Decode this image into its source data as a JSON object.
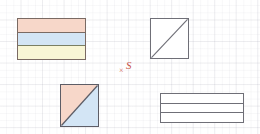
{
  "canvas": {
    "width": 260,
    "height": 134,
    "background_color": "#ffffff",
    "description": "Graph-paper worksheet with four geometric figures and a centre annotation"
  },
  "grid": {
    "name": "graph-paper-grid",
    "major_spacing_px": 21.5,
    "minor_spacing_px": 7.2,
    "major_color": "#b4b4be",
    "minor_color": "#aaaab9",
    "visible": true
  },
  "palette": {
    "pink": "#f7d7c9",
    "blue": "#d3e5f5",
    "yellow": "#f8f6d6",
    "outline_warm": "#7a6a63",
    "outline_olive": "#7a7f63",
    "outline_gray": "#6f6f77",
    "outline_dark": "#5d5d66",
    "annotation_red": "#c9564a",
    "white": "#ffffff"
  },
  "shapes": [
    {
      "id": "banded-colored",
      "label": "Rectangle divided into three horizontal bands",
      "type": "rectangle",
      "position": {
        "x": 17,
        "y": 18
      },
      "size": {
        "width": 69,
        "height": 42
      },
      "divisions": 3,
      "orientation": "horizontal",
      "bands": [
        {
          "index": 1,
          "fill": "#f7d7c9",
          "name": "pink-band"
        },
        {
          "index": 2,
          "fill": "#d3e5f5",
          "name": "blue-band"
        },
        {
          "index": 3,
          "fill": "#f8f6d6",
          "name": "yellow-band"
        }
      ],
      "outline_color": "#7a6a63"
    },
    {
      "id": "square-diagonal",
      "label": "Square with a diagonal from bottom-left to top-right",
      "type": "square",
      "position": {
        "x": 150,
        "y": 18
      },
      "size": {
        "width": 39,
        "height": 41
      },
      "divisions": 2,
      "orientation": "diagonal",
      "fill": "#ffffff",
      "outline_color": "#6f6f77",
      "diagonal": {
        "from": "bottom-left",
        "to": "top-right"
      }
    },
    {
      "id": "square-split",
      "label": "Square split by a diagonal into two coloured triangles",
      "type": "square",
      "position": {
        "x": 60,
        "y": 84
      },
      "size": {
        "width": 39,
        "height": 43
      },
      "divisions": 2,
      "orientation": "diagonal",
      "outline_color": "#5d5d66",
      "diagonal": {
        "from": "bottom-left",
        "to": "top-right"
      },
      "regions": [
        {
          "index": 1,
          "fill": "#f7d7c9",
          "name": "upper-left-triangle"
        },
        {
          "index": 2,
          "fill": "#d3e5f5",
          "name": "lower-right-triangle"
        }
      ]
    },
    {
      "id": "banded-empty",
      "label": "Rectangle divided into three horizontal bands, unfilled",
      "type": "rectangle",
      "position": {
        "x": 160,
        "y": 93
      },
      "size": {
        "width": 84,
        "height": 30
      },
      "divisions": 3,
      "orientation": "horizontal",
      "fill": "#ffffff",
      "outline_color": "#6f6f77",
      "bands": [
        {
          "index": 1,
          "fill": "#ffffff",
          "name": "top-band"
        },
        {
          "index": 2,
          "fill": "#ffffff",
          "name": "middle-band"
        },
        {
          "index": 3,
          "fill": "#ffffff",
          "name": "bottom-band"
        }
      ]
    }
  ],
  "annotation": {
    "name": "center-annotation",
    "x_mark": "×",
    "letter": "S",
    "color": "#c9564a",
    "position": {
      "x": 119,
      "y": 60
    }
  }
}
